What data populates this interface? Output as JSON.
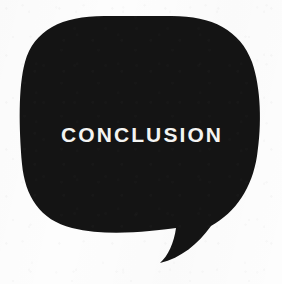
{
  "canvas": {
    "width": 282,
    "height": 284,
    "background_color": "#fdfdfd"
  },
  "bubble": {
    "label": "CONCLUSION",
    "fill_color": "#141414",
    "text_color": "#f4f4f2",
    "shape": "rounded-square-speech-bubble",
    "tail_position": "bottom-right",
    "tail_direction": "down-left",
    "outline_path": "M 104 16 C 62 16 34 30 25 62 C 18 88 19 128 22 164 C 25 196 40 220 72 228 C 108 237 152 231 176 228 C 174 243 168 256 160 263 C 181 258 198 244 211 226 C 236 212 252 188 257 156 C 262 124 261 88 252 62 C 240 30 212 16 172 16 Z"
  }
}
